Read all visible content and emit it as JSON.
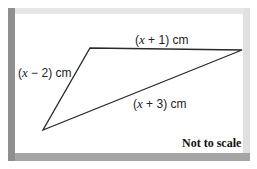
{
  "figure": {
    "type": "triangle",
    "note": "Not to scale",
    "sides": [
      {
        "id": "top",
        "prefix": "(",
        "var": "x",
        "suffix": " + 1) cm"
      },
      {
        "id": "left",
        "prefix": "(",
        "var": "x",
        "suffix": " − 2) cm"
      },
      {
        "id": "bottom",
        "prefix": "(",
        "var": "x",
        "suffix": " + 3) cm"
      }
    ],
    "vertices": {
      "top_left": [
        90,
        48
      ],
      "right": [
        242,
        50
      ],
      "bottom_left": [
        43,
        130
      ]
    },
    "colors": {
      "line": "#2a2a2a",
      "frame_dark": "#8f8f8f",
      "frame_light": "#e6e6e6",
      "background": "#ffffff"
    }
  }
}
